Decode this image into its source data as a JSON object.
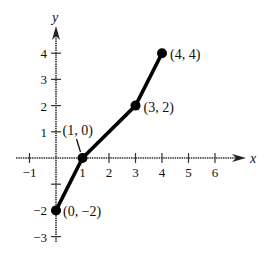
{
  "chart_data": {
    "type": "line",
    "title": "",
    "xlabel": "x",
    "ylabel": "y",
    "xlim": [
      -1.5,
      7.2
    ],
    "ylim": [
      -3.5,
      5.2
    ],
    "grid": false,
    "legend": null,
    "x_ticks": [
      -1,
      1,
      2,
      3,
      4,
      5,
      6
    ],
    "y_ticks": [
      4,
      3,
      2,
      1,
      -2,
      -3
    ],
    "x_tick_labels": [
      "−1",
      "1",
      "2",
      "3",
      "4",
      "5",
      "6"
    ],
    "y_tick_labels": [
      "4",
      "3",
      "2",
      "1",
      "−2",
      "−3"
    ],
    "series": [
      {
        "name": "piecewise linear",
        "x": [
          0,
          1,
          3,
          4
        ],
        "y": [
          -2,
          0,
          2,
          4
        ],
        "marker": "filled-circle",
        "color": "#000000"
      }
    ],
    "annotations": [
      {
        "text": "(0, −2)",
        "x": 0,
        "y": -2
      },
      {
        "text": "(1, 0)",
        "x": 1,
        "y": 0
      },
      {
        "text": "(3, 2)",
        "x": 3,
        "y": 2
      },
      {
        "text": "(4, 4)",
        "x": 4,
        "y": 4
      }
    ]
  },
  "style": {
    "line_color": "#000000",
    "axis_color": "#333333",
    "background": "#ffffff"
  }
}
